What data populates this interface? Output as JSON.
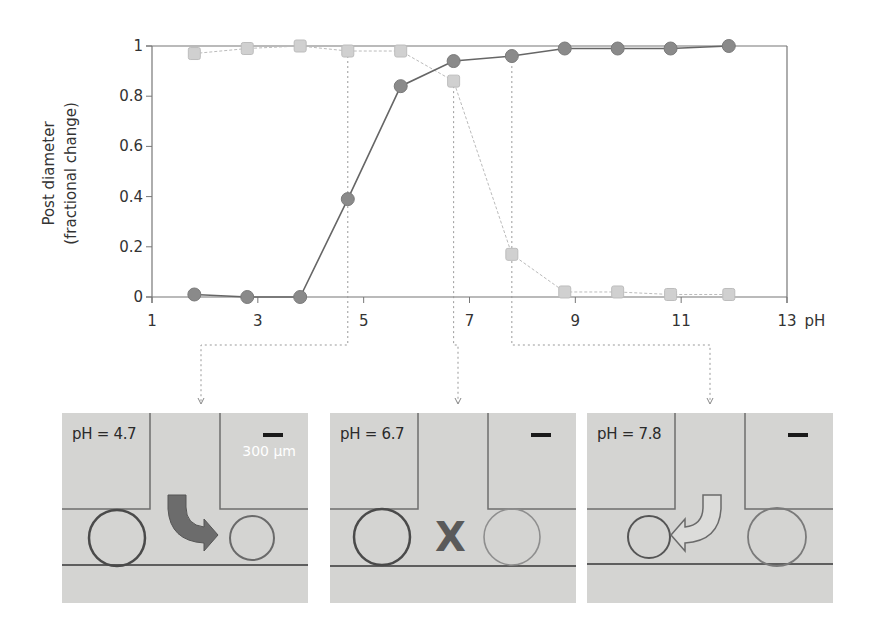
{
  "chart_data": {
    "type": "line",
    "title": "",
    "xlabel": "pH",
    "ylabel": "Post diameter (fractional change)",
    "ylabel_lines": [
      "Post diameter",
      "(fractional change)"
    ],
    "xlim": [
      1,
      13
    ],
    "ylim": [
      0,
      1
    ],
    "xticks": [
      1,
      3,
      5,
      7,
      9,
      11,
      13
    ],
    "yticks": [
      0,
      0.2,
      0.4,
      0.6,
      0.8,
      1
    ],
    "ytick_labels": [
      "0",
      "0.2",
      "0.4",
      "0.6",
      "0.8",
      "1"
    ],
    "xtick_labels": [
      "1",
      "3",
      "5",
      "7",
      "9",
      "11",
      "13"
    ],
    "grid": false,
    "legend": null,
    "x": [
      1.8,
      2.8,
      3.8,
      4.7,
      5.7,
      6.7,
      7.8,
      8.8,
      9.8,
      10.8,
      11.9
    ],
    "series": [
      {
        "name": "circles (dark)",
        "marker": "circle",
        "color": "#8a8a8a",
        "line_color": "#666666",
        "values": [
          0.01,
          0.0,
          0.0,
          0.39,
          0.84,
          0.94,
          0.96,
          0.99,
          0.99,
          0.99,
          1.0
        ]
      },
      {
        "name": "squares (light)",
        "marker": "square",
        "color": "#d0d0d0",
        "line_color": "#bbbbbb",
        "values": [
          0.97,
          0.99,
          1.0,
          0.98,
          0.98,
          0.86,
          0.17,
          0.02,
          0.02,
          0.01,
          0.01
        ]
      }
    ],
    "annotations": [
      {
        "type": "vline",
        "x": 4.7,
        "target_panel": 0
      },
      {
        "type": "vline",
        "x": 6.7,
        "target_panel": 1
      },
      {
        "type": "vline",
        "x": 7.8,
        "target_panel": 2
      }
    ]
  },
  "panels": [
    {
      "label": "pH = 4.7",
      "scale_text": "300 μm",
      "symbol": "curved-arrow-right-filled"
    },
    {
      "label": "pH = 6.7",
      "scale_text": "",
      "symbol": "X"
    },
    {
      "label": "pH = 7.8",
      "scale_text": "",
      "symbol": "curved-arrow-left-outline"
    }
  ]
}
